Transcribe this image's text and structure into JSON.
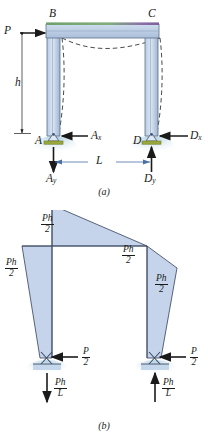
{
  "figure": {
    "panels": [
      {
        "id": "a",
        "caption": "(a)",
        "description": "Portal frame with horizontal load P at joint B, deflected shape shown dashed",
        "joints": {
          "top_left": "B",
          "top_right": "C",
          "bottom_left": "A",
          "bottom_right": "D"
        },
        "loads": [
          {
            "name": "applied-load",
            "label": "P",
            "direction": "right"
          }
        ],
        "reactions": [
          {
            "name": "reaction-ax",
            "label": "A",
            "subscript": "x",
            "direction": "left"
          },
          {
            "name": "reaction-dx",
            "label": "D",
            "subscript": "x",
            "direction": "left"
          },
          {
            "name": "reaction-ay",
            "label": "A",
            "subscript": "y",
            "direction": "down"
          },
          {
            "name": "reaction-dy",
            "label": "D",
            "subscript": "y",
            "direction": "up"
          }
        ],
        "dimensions": [
          {
            "name": "height-dimension",
            "label": "h",
            "orientation": "vertical"
          },
          {
            "name": "span-dimension",
            "label": "L",
            "orientation": "horizontal"
          }
        ]
      },
      {
        "id": "b",
        "caption": "(b)",
        "description": "Bending moment diagram with support reactions",
        "moment_labels": [
          {
            "name": "moment-left-column",
            "numerator": "Ph",
            "denominator": "2"
          },
          {
            "name": "moment-top-left",
            "numerator": "Ph",
            "denominator": "2"
          },
          {
            "name": "moment-top-right",
            "numerator": "Ph",
            "denominator": "2"
          },
          {
            "name": "moment-right-column",
            "numerator": "Ph",
            "denominator": "2"
          }
        ],
        "reactions": [
          {
            "name": "shear-left",
            "numerator": "P",
            "denominator": "2",
            "direction": "left"
          },
          {
            "name": "shear-right",
            "numerator": "P",
            "denominator": "2",
            "direction": "left"
          },
          {
            "name": "axial-left",
            "numerator": "Ph",
            "denominator": "L",
            "direction": "down"
          },
          {
            "name": "axial-right",
            "numerator": "Ph",
            "denominator": "L",
            "direction": "up"
          }
        ]
      }
    ]
  },
  "colors": {
    "member_fill": "#c3d2e8",
    "member_edge": "#5a6f8c",
    "moment_fill": "#c5d4ea",
    "moment_edge": "#3c4a63",
    "support_base": "#9aa83c",
    "ground_shade": "#bcd7e8",
    "beam_top_green": "#7fae7a",
    "beam_top_purple": "#8a6fa8",
    "line": "#1a1a1a"
  }
}
